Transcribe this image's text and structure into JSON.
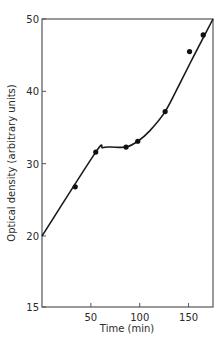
{
  "chart_data": {
    "type": "scatter",
    "title": "",
    "xlabel": "Time (min)",
    "ylabel": "Optical density (arbitrary units)",
    "xlim": [
      0,
      175
    ],
    "ylim": [
      15,
      50
    ],
    "x_ticks": [
      50,
      100,
      150
    ],
    "x_tick_labels": [
      "50",
      "100",
      "150"
    ],
    "y_ticks": [
      15,
      20,
      30,
      40,
      50
    ],
    "y_tick_labels": [
      "15",
      "20",
      "30",
      "40",
      "50"
    ],
    "y_axis_note": "tick labels equally spaced; 15 at bottom implies axis break below 20",
    "grid": false,
    "legend": "none",
    "series": [
      {
        "name": "measured",
        "type": "scatter",
        "x": [
          34,
          55,
          86,
          98,
          126,
          151,
          165
        ],
        "y": [
          26.8,
          31.6,
          32.3,
          33.1,
          37.2,
          45.5,
          47.8
        ]
      },
      {
        "name": "fitted curve",
        "type": "line",
        "x": [
          0,
          55,
          62,
          70,
          86,
          98,
          110,
          126,
          140,
          155,
          175
        ],
        "y": [
          20,
          31.6,
          32.2,
          32.3,
          32.3,
          33.1,
          34.5,
          37.2,
          40.8,
          44.8,
          50
        ]
      }
    ]
  }
}
